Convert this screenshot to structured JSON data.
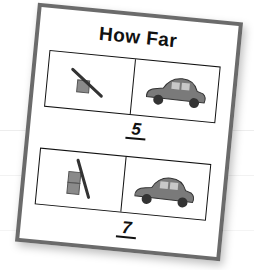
{
  "card": {
    "title": "How Far",
    "rows": [
      {
        "ramp": "ramp-one-block",
        "vehicle": "toy-car",
        "answer": "5"
      },
      {
        "ramp": "ramp-two-blocks",
        "vehicle": "toy-car",
        "answer": "7"
      }
    ]
  },
  "colors": {
    "card_border": "#6b6b6b",
    "ink": "#111111",
    "block": "#8a8a8a",
    "car": "#7a7a7a"
  }
}
